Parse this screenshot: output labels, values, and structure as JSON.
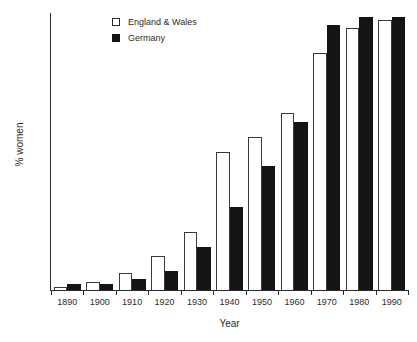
{
  "chart_data": {
    "type": "bar",
    "title": "",
    "xlabel": "Year",
    "ylabel": "% women",
    "categories": [
      "1890",
      "1900",
      "1910",
      "1920",
      "1930",
      "1940",
      "1950",
      "1960",
      "1970",
      "1980",
      "1990"
    ],
    "series": [
      {
        "name": "England & Wales",
        "style": "open",
        "color": "#ffffff",
        "edge_color": "#3a3a3a",
        "values": [
          1,
          3,
          6,
          12.5,
          21,
          50,
          55.5,
          64,
          86,
          95,
          98
        ]
      },
      {
        "name": "Germany",
        "style": "filled",
        "color": "#141414",
        "edge_color": "#141414",
        "values": [
          2,
          2,
          4,
          7,
          15.5,
          30,
          45,
          61,
          96,
          99,
          99
        ]
      }
    ],
    "ylim": [
      0,
      100
    ],
    "yticks": [
      0,
      20,
      40,
      60,
      80,
      100
    ],
    "yticks_minor": [
      10,
      30,
      50,
      70,
      90
    ],
    "ytick_labels": [
      "0",
      "20",
      "40",
      "60",
      "80",
      "100"
    ],
    "grid": false,
    "legend_position": "top-left-inside"
  },
  "legend": {
    "entries": [
      {
        "label": "England & Wales",
        "swatch": "open-square-icon"
      },
      {
        "label": "Germany",
        "swatch": "filled-square-icon"
      }
    ]
  },
  "axes": {
    "x_title": "Year",
    "y_title": "% women"
  }
}
